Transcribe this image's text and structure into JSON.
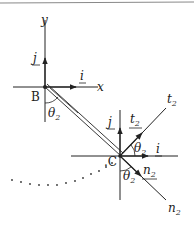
{
  "diagram": {
    "points": {
      "B": "B",
      "C": "C"
    },
    "axes": {
      "x_label": "x",
      "y_label": "y",
      "t2_label": "t",
      "t2_sub": "2",
      "n2_label": "n",
      "n2_sub": "2"
    },
    "vectors_at_B": {
      "i": "i",
      "j": "j"
    },
    "vectors_at_C": {
      "i": "i",
      "j": "j",
      "t": "t",
      "t_sub": "2",
      "n": "n",
      "n_sub": "2"
    },
    "angles": {
      "theta": "θ",
      "sub": "2"
    },
    "colors": {
      "line": "#222222",
      "border": "#888888"
    }
  }
}
